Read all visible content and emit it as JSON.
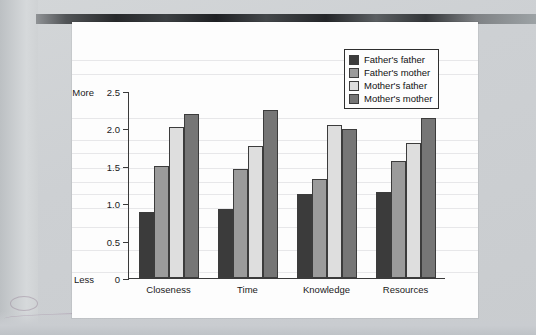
{
  "chart_data": {
    "type": "bar",
    "title": "",
    "xlabel": "",
    "ylabel": "",
    "ylim": [
      0,
      2.5
    ],
    "yticks": [
      "0",
      "0.5",
      "1.0",
      "1.5",
      "2.0",
      "2.5"
    ],
    "ytick_values": [
      0,
      0.5,
      1.0,
      1.5,
      2.0,
      2.5
    ],
    "axis_anchor_high": "More",
    "axis_anchor_low": "Less",
    "grid": false,
    "legend_position": "top-right",
    "categories": [
      "Closeness",
      "Time",
      "Knowledge",
      "Resources"
    ],
    "series": [
      {
        "name": "Father's father",
        "color": "#3b3b3b",
        "values": [
          0.88,
          0.92,
          1.12,
          1.15
        ]
      },
      {
        "name": "Father's mother",
        "color": "#9b9b9b",
        "values": [
          1.5,
          1.46,
          1.32,
          1.56
        ]
      },
      {
        "name": "Mother's father",
        "color": "#dedede",
        "values": [
          2.02,
          1.77,
          2.05,
          1.8
        ]
      },
      {
        "name": "Mother's mother",
        "color": "#767676",
        "values": [
          2.19,
          2.24,
          1.99,
          2.14
        ]
      }
    ]
  }
}
